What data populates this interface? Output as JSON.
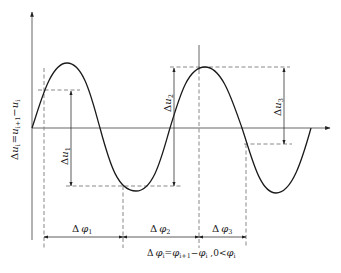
{
  "diagram": {
    "type": "waveform-phase-difference",
    "colors": {
      "background": "#ffffff",
      "curve": "#1a1a1a",
      "axis": "#555555",
      "guide_dashed": "#7a7a7a",
      "text": "#1a1a1a"
    },
    "y_axis_label": {
      "delta": "Δ",
      "main": "u",
      "main_sub": "i",
      "equals": "=",
      "term1": "u",
      "term1_sub": "i+1",
      "minus": "−",
      "term2": "u",
      "term2_sub": "i"
    },
    "amplitude_labels": [
      {
        "delta": "Δ",
        "var": "u",
        "sub": "1"
      },
      {
        "delta": "Δ",
        "var": "u",
        "sub": "2"
      },
      {
        "delta": "Δ",
        "var": "u",
        "sub": "3"
      }
    ],
    "phase_labels": [
      {
        "delta": "Δ",
        "var": "φ",
        "sub": "1"
      },
      {
        "delta": "Δ",
        "var": "φ",
        "sub": "2"
      },
      {
        "delta": "Δ",
        "var": "φ",
        "sub": "3"
      }
    ],
    "formula": {
      "delta": "Δ",
      "lhs": "φ",
      "lhs_sub": "i",
      "equals": "=",
      "t1": "φ",
      "t1_sub": "i+1",
      "minus": "−",
      "t2": "φ",
      "t2_sub": "i",
      "sep": " ,0<",
      "t3": "φ",
      "t3_sub": "i"
    },
    "waveform": {
      "extrema": [
        {
          "kind": "peak",
          "x": 67,
          "y": 63
        },
        {
          "kind": "trough",
          "x": 136,
          "y": 191
        },
        {
          "kind": "peak",
          "x": 205,
          "y": 67
        },
        {
          "kind": "trough",
          "x": 276,
          "y": 193
        }
      ],
      "zero_crossings_x": [
        32,
        100,
        170,
        242,
        311
      ],
      "baseline_y": 128
    }
  }
}
